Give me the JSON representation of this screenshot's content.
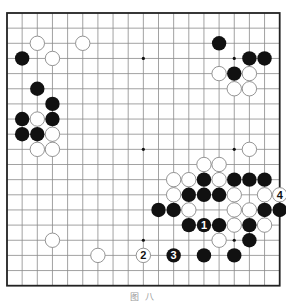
{
  "diagram": {
    "type": "go-board",
    "size": 19,
    "origin_px": [
      7,
      13
    ],
    "step_px": 15.15,
    "colors": {
      "line": "#8a8a8a",
      "border": "#222222",
      "black": "#111111",
      "white": "#ffffff",
      "white_outline": "#888888"
    },
    "star_points": [
      [
        3,
        3
      ],
      [
        9,
        3
      ],
      [
        15,
        3
      ],
      [
        3,
        9
      ],
      [
        9,
        9
      ],
      [
        15,
        9
      ],
      [
        3,
        15
      ],
      [
        9,
        15
      ],
      [
        15,
        15
      ]
    ],
    "stones": [
      {
        "c": 2,
        "r": 2,
        "color": "white"
      },
      {
        "c": 5,
        "r": 2,
        "color": "white"
      },
      {
        "c": 1,
        "r": 3,
        "color": "black"
      },
      {
        "c": 3,
        "r": 3,
        "color": "white"
      },
      {
        "c": 2,
        "r": 5,
        "color": "black"
      },
      {
        "c": 3,
        "r": 6,
        "color": "black"
      },
      {
        "c": 1,
        "r": 7,
        "color": "black"
      },
      {
        "c": 2,
        "r": 7,
        "color": "white"
      },
      {
        "c": 3,
        "r": 7,
        "color": "black"
      },
      {
        "c": 1,
        "r": 8,
        "color": "black"
      },
      {
        "c": 2,
        "r": 8,
        "color": "black"
      },
      {
        "c": 3,
        "r": 8,
        "color": "white"
      },
      {
        "c": 2,
        "r": 9,
        "color": "white"
      },
      {
        "c": 3,
        "r": 9,
        "color": "white"
      },
      {
        "c": 14,
        "r": 2,
        "color": "black"
      },
      {
        "c": 16,
        "r": 3,
        "color": "black"
      },
      {
        "c": 17,
        "r": 3,
        "color": "black"
      },
      {
        "c": 14,
        "r": 4,
        "color": "white"
      },
      {
        "c": 15,
        "r": 4,
        "color": "black"
      },
      {
        "c": 16,
        "r": 4,
        "color": "white"
      },
      {
        "c": 15,
        "r": 5,
        "color": "white"
      },
      {
        "c": 16,
        "r": 5,
        "color": "white"
      },
      {
        "c": 16,
        "r": 9,
        "color": "white"
      },
      {
        "c": 13,
        "r": 10,
        "color": "white"
      },
      {
        "c": 14,
        "r": 10,
        "color": "white"
      },
      {
        "c": 11,
        "r": 11,
        "color": "white"
      },
      {
        "c": 12,
        "r": 11,
        "color": "white"
      },
      {
        "c": 13,
        "r": 11,
        "color": "black"
      },
      {
        "c": 14,
        "r": 11,
        "color": "white"
      },
      {
        "c": 15,
        "r": 11,
        "color": "black"
      },
      {
        "c": 16,
        "r": 11,
        "color": "black"
      },
      {
        "c": 17,
        "r": 11,
        "color": "black"
      },
      {
        "c": 11,
        "r": 12,
        "color": "white"
      },
      {
        "c": 12,
        "r": 12,
        "color": "black"
      },
      {
        "c": 13,
        "r": 12,
        "color": "black"
      },
      {
        "c": 14,
        "r": 12,
        "color": "black"
      },
      {
        "c": 15,
        "r": 12,
        "color": "white"
      },
      {
        "c": 17,
        "r": 12,
        "color": "white"
      },
      {
        "c": 18,
        "r": 12,
        "color": "white",
        "label": "4"
      },
      {
        "c": 10,
        "r": 13,
        "color": "black"
      },
      {
        "c": 11,
        "r": 13,
        "color": "black"
      },
      {
        "c": 12,
        "r": 13,
        "color": "white"
      },
      {
        "c": 15,
        "r": 13,
        "color": "white"
      },
      {
        "c": 16,
        "r": 13,
        "color": "white"
      },
      {
        "c": 17,
        "r": 13,
        "color": "black"
      },
      {
        "c": 18,
        "r": 13,
        "color": "black"
      },
      {
        "c": 12,
        "r": 14,
        "color": "black"
      },
      {
        "c": 13,
        "r": 14,
        "color": "black",
        "label": "1"
      },
      {
        "c": 14,
        "r": 14,
        "color": "black"
      },
      {
        "c": 15,
        "r": 14,
        "color": "white"
      },
      {
        "c": 16,
        "r": 14,
        "color": "black"
      },
      {
        "c": 17,
        "r": 14,
        "color": "white"
      },
      {
        "c": 14,
        "r": 15,
        "color": "white"
      },
      {
        "c": 16,
        "r": 15,
        "color": "black"
      },
      {
        "c": 3,
        "r": 15,
        "color": "white"
      },
      {
        "c": 6,
        "r": 16,
        "color": "white"
      },
      {
        "c": 9,
        "r": 16,
        "color": "white",
        "label": "2"
      },
      {
        "c": 11,
        "r": 16,
        "color": "black",
        "label": "3"
      },
      {
        "c": 13,
        "r": 16,
        "color": "black"
      },
      {
        "c": 15,
        "r": 16,
        "color": "black"
      }
    ]
  },
  "caption": "图 八"
}
